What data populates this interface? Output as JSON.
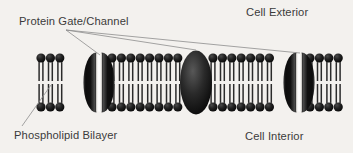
{
  "figure": {
    "background_color": "#f3f1ee",
    "ink_color": "#1a1a1a",
    "leader_line_color": "#8d8d8d",
    "text_color": "#3b3b3b"
  },
  "labels": {
    "protein": "Protein Gate/Channel",
    "exterior": "Cell Exterior",
    "bilayer": "Phospholipid Bilayer",
    "interior": "Cell Interior"
  },
  "membrane": {
    "top_head_row_y": 58,
    "bottom_head_row_y": 107,
    "head_radius": 4.6,
    "head_spacing": 9.4,
    "left_edge_x": 40,
    "right_edge_x": 345,
    "tail_color": "#ffffff",
    "tail_outline_color": "#2b2b2b",
    "segments": [
      {
        "name": "segment-1",
        "start_x": 41,
        "head_count": 3
      },
      {
        "name": "segment-2",
        "start_x": 112,
        "head_count": 8
      },
      {
        "name": "segment-3",
        "start_x": 213,
        "head_count": 7
      },
      {
        "name": "segment-4",
        "start_x": 310,
        "head_count": 4
      }
    ]
  },
  "proteins": [
    {
      "name": "protein-gate-left",
      "cx": 99,
      "rx": 13,
      "ry": 30,
      "state": "open",
      "channel": true
    },
    {
      "name": "protein-gate-middle",
      "cx": 196,
      "rx": 16,
      "ry": 32,
      "state": "closed",
      "channel": false
    },
    {
      "name": "protein-gate-right",
      "cx": 299,
      "rx": 13,
      "ry": 30,
      "state": "open",
      "channel": true
    }
  ],
  "leader_lines": [
    {
      "name": "leader-protein-left",
      "x1": 66,
      "y1": 30,
      "x2": 100,
      "y2": 55
    },
    {
      "name": "leader-protein-middle",
      "x1": 66,
      "y1": 30,
      "x2": 196,
      "y2": 50
    },
    {
      "name": "leader-protein-right",
      "x1": 66,
      "y1": 30,
      "x2": 300,
      "y2": 53
    },
    {
      "name": "leader-bilayer",
      "x1": 22,
      "y1": 126,
      "x2": 51,
      "y2": 85
    }
  ]
}
